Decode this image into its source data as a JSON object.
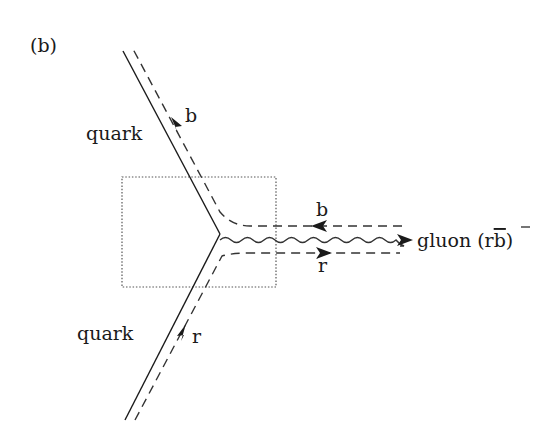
{
  "figure": {
    "panel_label": "(b)",
    "incoming_quark": {
      "label": "quark",
      "color_label": "b",
      "color": "blue"
    },
    "outgoing_quark": {
      "label": "quark",
      "color_label": "r",
      "color": "red"
    },
    "gluon": {
      "label": "gluon (r",
      "anti": "b",
      "close": ")"
    },
    "gluon_upper_line_label": "b",
    "gluon_lower_line_label": "r",
    "highlight_box": "vertex region (dotted rectangle)"
  },
  "colors": {
    "line": "#1a1a1a",
    "dashed": "#333333",
    "box": "#555555",
    "background": "#ffffff"
  }
}
